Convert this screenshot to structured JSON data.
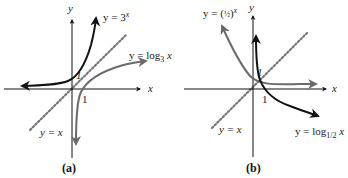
{
  "colors": {
    "axis": "#111111",
    "dark_curve": "#111111",
    "gray_curve": "#6a6a6a",
    "identity_line": "#777777",
    "background": "#ffffff"
  },
  "panels": [
    {
      "caption": "(a)",
      "axis_x_label": "x",
      "axis_y_label": "y",
      "tick_x_label": "1",
      "tick_y_label": "1",
      "curves": [
        {
          "label_prefix": "y = 3",
          "label_sup": "x",
          "style": "dark",
          "kind": "exponential"
        },
        {
          "label_prefix": "y = log",
          "label_sub": "3",
          "label_suffix": " x",
          "style": "gray",
          "kind": "logarithm"
        },
        {
          "label": "y = x",
          "style": "dotted",
          "kind": "identity"
        }
      ]
    },
    {
      "caption": "(b)",
      "axis_x_label": "x",
      "axis_y_label": "y",
      "tick_x_label": "1",
      "tick_y_label": "1",
      "curves": [
        {
          "label_prefix": "y = (",
          "label_frac": "½",
          "label_close": ")",
          "label_sup": "x",
          "style": "gray",
          "kind": "exponential"
        },
        {
          "label_prefix": "y = log",
          "label_sub": "1/2",
          "label_suffix": " x",
          "style": "dark",
          "kind": "logarithm"
        },
        {
          "label": "y = x",
          "style": "dotted",
          "kind": "identity"
        }
      ]
    }
  ]
}
